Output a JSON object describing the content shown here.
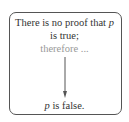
{
  "diagram": {
    "premise": {
      "line1_prefix": "There is no proof that ",
      "line1_var": "p",
      "line2": "is true;"
    },
    "connector": "therefore ...",
    "conclusion": {
      "var": "p",
      "suffix": " is false."
    },
    "colors": {
      "border": "#555555",
      "text": "#333333",
      "connector": "#999999",
      "arrow": "#555555"
    }
  }
}
